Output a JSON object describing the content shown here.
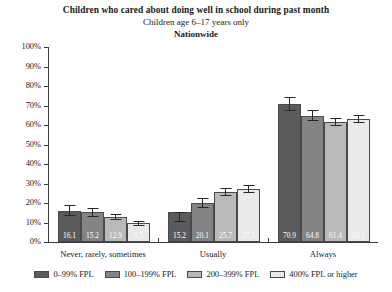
{
  "chart_data": {
    "type": "bar",
    "title": "Children who cared about doing well in school during past month",
    "subtitle": "Children age 6–17 years only",
    "subtitle2": "Nationwide",
    "xlabel": "",
    "ylabel": "",
    "ylim": [
      0,
      100
    ],
    "grid": false,
    "legend_position": "bottom",
    "categories": [
      "Never, rarely, sometimes",
      "Usually",
      "Always"
    ],
    "ytick_labels": [
      "0%",
      "10%",
      "20%",
      "30%",
      "40%",
      "50%",
      "60%",
      "70%",
      "80%",
      "90%",
      "100%"
    ],
    "ytick_values": [
      0,
      10,
      20,
      30,
      40,
      50,
      60,
      70,
      80,
      90,
      100
    ],
    "series": [
      {
        "name": "0–99% FPL",
        "color": "#5b5b5d",
        "values": [
          16.1,
          15.2,
          70.9
        ],
        "labels": [
          "16.1",
          "15.2",
          "70.9"
        ],
        "err_low": [
          13.2,
          10.4,
          67.4
        ],
        "err_high": [
          19.0,
          15.6,
          74.4
        ]
      },
      {
        "name": "100–199% FPL",
        "color": "#848486",
        "values": [
          15.2,
          20.1,
          64.8
        ],
        "labels": [
          "15.2",
          "20.1",
          "64.8"
        ],
        "err_low": [
          12.8,
          17.6,
          62.0
        ],
        "err_high": [
          17.6,
          22.6,
          67.6
        ]
      },
      {
        "name": "200–399% FPL",
        "color": "#b9b9b9",
        "values": [
          12.9,
          25.7,
          61.4
        ],
        "labels": [
          "12.9",
          "25.7",
          "61.4"
        ],
        "err_low": [
          11.2,
          23.6,
          59.3
        ],
        "err_high": [
          14.6,
          27.8,
          63.5
        ]
      },
      {
        "name": "400% FPL or higher",
        "color": "#e9e9e7",
        "values": [
          9.5,
          27.3,
          63.1
        ],
        "labels": [
          "9.5",
          "27.3",
          "63.1"
        ],
        "err_low": [
          8.0,
          25.2,
          61.0
        ],
        "err_high": [
          11.0,
          29.4,
          65.2
        ]
      }
    ]
  }
}
